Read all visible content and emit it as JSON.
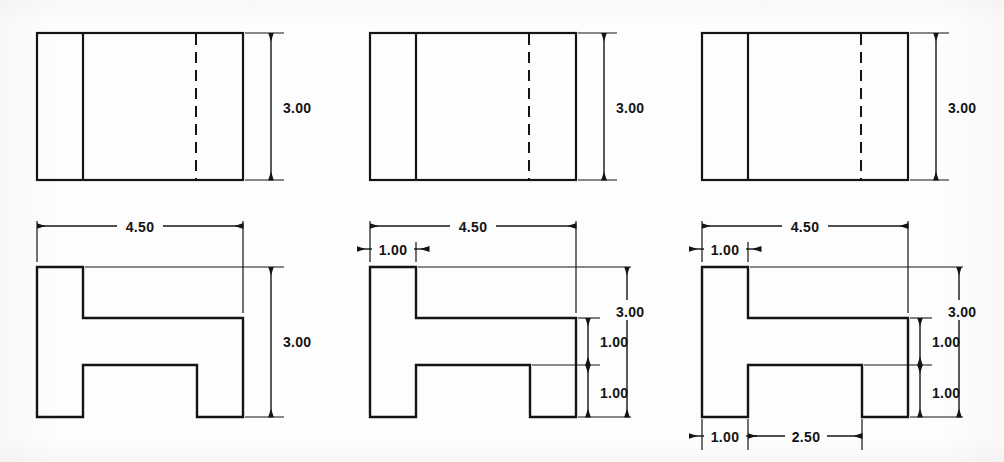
{
  "document": {
    "title": "Progressive Dimensioning of H-Block Orthographic Views",
    "background_color": "#fdfdfd",
    "line_color": "#141414",
    "text_color": "#141414"
  },
  "drawing": {
    "type": "orthographic-multiview-technical-drawing",
    "stage_count": 3,
    "description": "Three side-by-side progressions of the same part: a top view rectangle with one solid edge line and one hidden (dashed) line, above a front view showing an H-shaped profile. Each stage adds more dimensions.",
    "part": {
      "overall_width": "4.50",
      "overall_height": "3.00",
      "flange_width": "1.00",
      "web_thickness": "1.00",
      "lower_flange_height": "1.00",
      "notch_width": "2.50"
    }
  },
  "stages": [
    {
      "id": "stage-1",
      "name": "stage-1-minimal-dimensions",
      "top_view": {
        "name": "top-view",
        "has_solid_divider": true,
        "has_hidden_dashed_line": true,
        "dimensions": [
          {
            "name": "height-dimension",
            "label": "3.00",
            "orientation": "vertical",
            "side": "right"
          }
        ]
      },
      "front_view": {
        "name": "front-view",
        "profile": "H-shape",
        "dimensions": [
          {
            "name": "overall-width-dimension",
            "label": "4.50",
            "orientation": "horizontal",
            "side": "top"
          },
          {
            "name": "overall-height-dimension",
            "label": "3.00",
            "orientation": "vertical",
            "side": "right"
          }
        ]
      }
    },
    {
      "id": "stage-2",
      "name": "stage-2-added-flange-and-web-dimensions",
      "top_view": {
        "name": "top-view",
        "has_solid_divider": true,
        "has_hidden_dashed_line": true,
        "dimensions": [
          {
            "name": "height-dimension",
            "label": "3.00",
            "orientation": "vertical",
            "side": "right"
          }
        ]
      },
      "front_view": {
        "name": "front-view",
        "profile": "H-shape",
        "dimensions": [
          {
            "name": "overall-width-dimension",
            "label": "4.50",
            "orientation": "horizontal",
            "side": "top"
          },
          {
            "name": "flange-width-dimension",
            "label": "1.00",
            "orientation": "horizontal",
            "side": "top-left"
          },
          {
            "name": "overall-height-dimension",
            "label": "3.00",
            "orientation": "vertical",
            "side": "right-outer"
          },
          {
            "name": "upper-web-height-dimension",
            "label": "1.00",
            "orientation": "vertical",
            "side": "right-inner-upper"
          },
          {
            "name": "lower-flange-height-dimension",
            "label": "1.00",
            "orientation": "vertical",
            "side": "right-inner-lower"
          }
        ]
      }
    },
    {
      "id": "stage-3",
      "name": "stage-3-fully-dimensioned",
      "top_view": {
        "name": "top-view",
        "has_solid_divider": true,
        "has_hidden_dashed_line": true,
        "dimensions": [
          {
            "name": "height-dimension",
            "label": "3.00",
            "orientation": "vertical",
            "side": "right"
          }
        ]
      },
      "front_view": {
        "name": "front-view",
        "profile": "H-shape",
        "dimensions": [
          {
            "name": "overall-width-dimension",
            "label": "4.50",
            "orientation": "horizontal",
            "side": "top"
          },
          {
            "name": "flange-width-dimension",
            "label": "1.00",
            "orientation": "horizontal",
            "side": "top-left"
          },
          {
            "name": "overall-height-dimension",
            "label": "3.00",
            "orientation": "vertical",
            "side": "right-outer"
          },
          {
            "name": "upper-web-height-dimension",
            "label": "1.00",
            "orientation": "vertical",
            "side": "right-inner-upper"
          },
          {
            "name": "lower-flange-height-dimension",
            "label": "1.00",
            "orientation": "vertical",
            "side": "right-inner-lower"
          },
          {
            "name": "bottom-left-flange-width-dimension",
            "label": "1.00",
            "orientation": "horizontal",
            "side": "bottom-left"
          },
          {
            "name": "bottom-notch-width-dimension",
            "label": "2.50",
            "orientation": "horizontal",
            "side": "bottom-center"
          }
        ]
      }
    }
  ],
  "labels": {
    "dim_4_50": "4.50",
    "dim_3_00": "3.00",
    "dim_1_00": "1.00",
    "dim_2_50": "2.50"
  }
}
